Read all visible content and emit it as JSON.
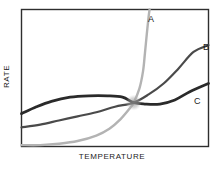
{
  "chart_data": {
    "type": "line",
    "title": "",
    "xlabel": "TEMPERATURE",
    "ylabel": "RATE",
    "grid": false,
    "legend_position": "inline-end-labels",
    "xlim": [
      0,
      100
    ],
    "ylim": [
      0,
      100
    ],
    "axis_ticks": {
      "x": [],
      "y": []
    },
    "annotations": [
      {
        "name": "common-intersection-point",
        "x": 60,
        "y": 32,
        "label": ""
      }
    ],
    "series": [
      {
        "name": "A",
        "label": "A",
        "color": "#b3b3b3",
        "width": 2.4,
        "points": [
          {
            "x": 0,
            "y": 1
          },
          {
            "x": 10,
            "y": 1
          },
          {
            "x": 20,
            "y": 2
          },
          {
            "x": 30,
            "y": 4
          },
          {
            "x": 40,
            "y": 8
          },
          {
            "x": 47,
            "y": 13
          },
          {
            "x": 53,
            "y": 20
          },
          {
            "x": 58,
            "y": 28
          },
          {
            "x": 60,
            "y": 32
          },
          {
            "x": 63,
            "y": 42
          },
          {
            "x": 65,
            "y": 55
          },
          {
            "x": 66,
            "y": 68
          },
          {
            "x": 67,
            "y": 82
          },
          {
            "x": 68,
            "y": 95
          },
          {
            "x": 68.5,
            "y": 100
          }
        ]
      },
      {
        "name": "B",
        "label": "B",
        "color": "#4a4a4a",
        "width": 2.2,
        "points": [
          {
            "x": 0,
            "y": 14
          },
          {
            "x": 10,
            "y": 16
          },
          {
            "x": 20,
            "y": 19
          },
          {
            "x": 30,
            "y": 22
          },
          {
            "x": 40,
            "y": 25
          },
          {
            "x": 50,
            "y": 29
          },
          {
            "x": 60,
            "y": 32
          },
          {
            "x": 68,
            "y": 38
          },
          {
            "x": 76,
            "y": 46
          },
          {
            "x": 84,
            "y": 57
          },
          {
            "x": 92,
            "y": 69
          },
          {
            "x": 100,
            "y": 74
          }
        ]
      },
      {
        "name": "C",
        "label": "C",
        "color": "#2a2a2a",
        "width": 2.8,
        "points": [
          {
            "x": 0,
            "y": 24
          },
          {
            "x": 8,
            "y": 29
          },
          {
            "x": 16,
            "y": 33
          },
          {
            "x": 26,
            "y": 36
          },
          {
            "x": 36,
            "y": 37
          },
          {
            "x": 46,
            "y": 37
          },
          {
            "x": 54,
            "y": 36
          },
          {
            "x": 60,
            "y": 32
          },
          {
            "x": 66,
            "y": 31
          },
          {
            "x": 74,
            "y": 31
          },
          {
            "x": 82,
            "y": 34
          },
          {
            "x": 90,
            "y": 40
          },
          {
            "x": 100,
            "y": 46
          }
        ]
      }
    ]
  },
  "frame": {
    "border_color": "#2e2e2e",
    "background": "#ffffff"
  }
}
